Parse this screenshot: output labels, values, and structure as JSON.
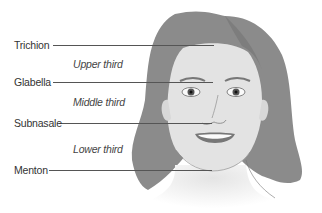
{
  "figure": {
    "landmarks": [
      {
        "label": "Trichion",
        "y": 45
      },
      {
        "label": "Glabella",
        "y": 82
      },
      {
        "label": "Subnasale",
        "y": 123
      },
      {
        "label": "Menton",
        "y": 170
      }
    ],
    "thirds": [
      {
        "label": "Upper third"
      },
      {
        "label": "Middle third"
      },
      {
        "label": "Lower third"
      }
    ]
  },
  "colors": {
    "hair": "#8a8a8a",
    "skin": "#e2e2e2",
    "line": "#555555",
    "lips": "#7a7a7a"
  }
}
